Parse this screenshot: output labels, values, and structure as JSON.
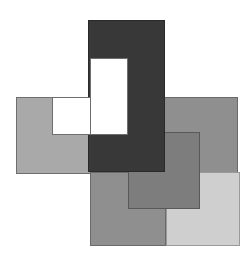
{
  "figure": {
    "canvas": {
      "width": 251,
      "height": 261,
      "background": "#ffffff"
    },
    "palette": {
      "white": "#ffffff",
      "light_gray": "#a9a9a9",
      "pale_gray": "#cfcfcf",
      "medium_gray": "#8f8f8f",
      "dark_gray": "#787878",
      "charcoal": "#383838",
      "outline": "#5a5a5a"
    },
    "shapes": [
      {
        "name": "left-light-gray-rectangle",
        "fill": "#a9a9a9",
        "stroke": "#6e6e6e",
        "x": 16,
        "y": 97,
        "width": 82,
        "height": 77
      },
      {
        "name": "right-medium-gray-rectangle",
        "fill": "#8f8f8f",
        "stroke": "#6a6a6a",
        "x": 156,
        "y": 97,
        "width": 82,
        "height": 78
      },
      {
        "name": "bottom-center-medium-gray-rectangle",
        "fill": "#8f8f8f",
        "stroke": "#6a6a6a",
        "x": 90,
        "y": 172,
        "width": 76,
        "height": 74
      },
      {
        "name": "bottom-right-pale-gray-rectangle",
        "fill": "#cfcfcf",
        "stroke": "#9a9a9a",
        "x": 166,
        "y": 172,
        "width": 74,
        "height": 74
      },
      {
        "name": "center-overlap-dark-gray-rectangle",
        "fill": "#7d7d7d",
        "stroke": "#585858",
        "x": 128,
        "y": 132,
        "width": 72,
        "height": 77
      },
      {
        "name": "charcoal-top-block",
        "fill": "#383838",
        "stroke": "#2a2a2a",
        "x": 88,
        "y": 20,
        "width": 77,
        "height": 152
      },
      {
        "name": "white-notch-cutout",
        "fill": "#ffffff",
        "stroke": "#6e6e6e",
        "x": 52,
        "y": 97,
        "width": 76,
        "height": 38
      },
      {
        "name": "white-notch-upper-cutout",
        "fill": "#ffffff",
        "stroke": "#6e6e6e",
        "x": 90,
        "y": 58,
        "width": 38,
        "height": 77
      }
    ],
    "labels": {
      "caption": "",
      "annotations": []
    }
  }
}
